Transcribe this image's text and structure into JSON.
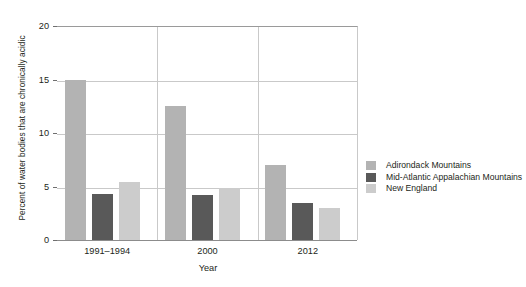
{
  "chart_data": {
    "type": "bar",
    "title": "",
    "subtitle": "",
    "xlabel": "Year",
    "ylabel": "Percent of water bodies that are chronically acidic",
    "categories": [
      "1991–1994",
      "2000",
      "2012"
    ],
    "series": [
      {
        "name": "Adirondack Mountains",
        "color": "#b3b3b3",
        "values": [
          15.0,
          12.5,
          7.0
        ]
      },
      {
        "name": "Mid-Atlantic Appalachian Mountains",
        "color": "#595959",
        "values": [
          4.3,
          4.2,
          3.5
        ]
      },
      {
        "name": "New England",
        "color": "#cccccc",
        "values": [
          5.4,
          4.9,
          3.0
        ]
      }
    ],
    "ylim": [
      0,
      20
    ],
    "yticks": [
      0,
      5,
      10,
      15,
      20
    ],
    "ytick_labels": [
      "0",
      "5",
      "10",
      "15",
      "20"
    ],
    "grid": "horizontal-and-category-dividers",
    "legend_position": "right",
    "axis_colors": {
      "gridline": "#c9c9c9",
      "axis": "#8c8c8c",
      "text": "#231f20",
      "background": "#ffffff"
    }
  },
  "legend": {
    "items": [
      {
        "label": "Adirondack Mountains",
        "color": "#b3b3b3"
      },
      {
        "label": "Mid-Atlantic Appalachian Mountains",
        "color": "#595959"
      },
      {
        "label": "New England",
        "color": "#cccccc"
      }
    ]
  }
}
